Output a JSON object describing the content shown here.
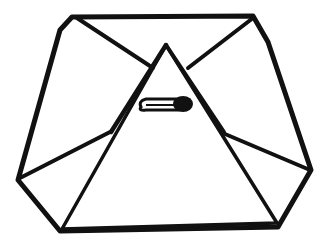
{
  "illustration": {
    "subject": "folded diaper with safety pin",
    "stroke_color": "#111111",
    "background_color": "#ffffff",
    "parts": [
      "outer-octagon-outline",
      "front-triangle-flap",
      "side-fold-lines",
      "safety-pin"
    ]
  }
}
